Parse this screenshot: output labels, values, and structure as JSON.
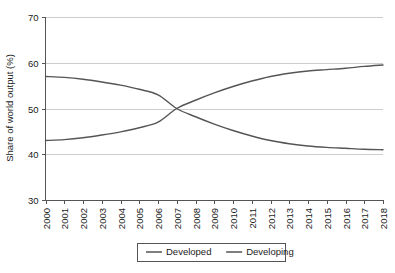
{
  "chart_data": {
    "type": "line",
    "title": "",
    "xlabel": "",
    "ylabel": "Share of world output (%)",
    "x": [
      2000,
      2001,
      2002,
      2003,
      2004,
      2005,
      2006,
      2007,
      2008,
      2009,
      2010,
      2011,
      2012,
      2013,
      2014,
      2015,
      2016,
      2017,
      2018
    ],
    "categories": [
      "2000",
      "2001",
      "2002",
      "2003",
      "2004",
      "2005",
      "2006",
      "2007",
      "2008",
      "2009",
      "2010",
      "2011",
      "2012",
      "2013",
      "2014",
      "2015",
      "2016",
      "2017",
      "2018"
    ],
    "series": [
      {
        "name": "Developed",
        "color": "#555555",
        "values": [
          57.0,
          56.8,
          56.4,
          55.8,
          55.1,
          54.2,
          53.0,
          50.0,
          48.2,
          46.6,
          45.2,
          44.0,
          43.0,
          42.3,
          41.8,
          41.5,
          41.3,
          41.1,
          41.0
        ]
      },
      {
        "name": "Developing",
        "color": "#555555",
        "values": [
          43.0,
          43.2,
          43.6,
          44.2,
          44.9,
          45.8,
          47.0,
          50.0,
          51.8,
          53.4,
          54.8,
          56.0,
          57.0,
          57.7,
          58.2,
          58.5,
          58.8,
          59.2,
          59.5
        ]
      }
    ],
    "ylim": [
      30,
      70
    ],
    "yticks": [
      30,
      40,
      50,
      60,
      70
    ],
    "yticklabels": [
      "30",
      "40",
      "50",
      "60",
      "70"
    ],
    "grid": "horizontal",
    "legend_position": "below-axis-center",
    "crossover": {
      "x": 2007,
      "y": 50
    }
  },
  "legend": {
    "items": [
      {
        "label": "Developed",
        "color": "#555555"
      },
      {
        "label": "Developing",
        "color": "#555555"
      }
    ]
  },
  "colors": {
    "background": "#ffffff",
    "gridline": "#cccccc",
    "axis": "#555555",
    "text": "#1a1a1a",
    "series_primary": "#555555"
  }
}
